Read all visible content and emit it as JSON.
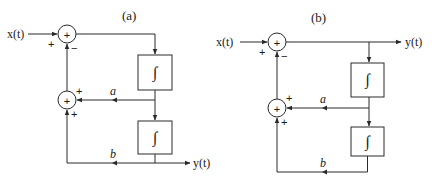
{
  "diagram": {
    "type": "block-diagram",
    "panels": [
      {
        "label": "(a)",
        "input": "x(t)",
        "output": "y(t)",
        "summer1": {
          "symbol": "+",
          "input_sign": "+",
          "feedback_sign": "−"
        },
        "summer2": {
          "symbol": "+",
          "sign_top": "+",
          "sign_bottom": "+"
        },
        "integrator1": "∫",
        "integrator2": "∫",
        "gain_a": "a",
        "gain_b": "b"
      },
      {
        "label": "(b)",
        "input": "x(t)",
        "output": "y(t)",
        "summer1": {
          "symbol": "+",
          "input_sign": "+",
          "feedback_sign": "−"
        },
        "summer2": {
          "symbol": "+",
          "sign_top": "+",
          "sign_bottom": "+"
        },
        "integrator1": "∫",
        "integrator2": "∫",
        "gain_a": "a",
        "gain_b": "b"
      }
    ],
    "colors": {
      "line": "#2a2a2a",
      "background": "#ffffff"
    }
  }
}
